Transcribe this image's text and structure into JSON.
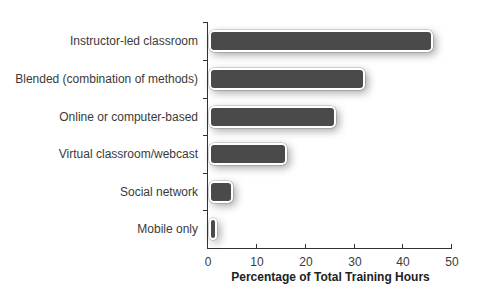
{
  "chart_data": {
    "type": "bar",
    "orientation": "horizontal",
    "title": "",
    "categories": [
      "Instructor-led classroom",
      "Blended (combination of methods)",
      "Online or computer-based",
      "Virtual classroom/webcast",
      "Social network",
      "Mobile only"
    ],
    "values": [
      46,
      32,
      26,
      16,
      5,
      1
    ],
    "xlabel": "Percentage of Total Training Hours",
    "ylabel": "",
    "xlim": [
      0,
      50
    ],
    "x_ticks": [
      "0",
      "10",
      "20",
      "30",
      "40",
      "50"
    ],
    "grid": false,
    "legend": null,
    "bar_color": "#4a4a4a"
  }
}
